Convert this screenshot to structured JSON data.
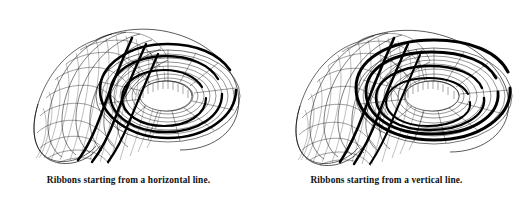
{
  "document": {
    "background_color": "#ffffff",
    "ink_color": "#000000",
    "width": 515,
    "height": 198
  },
  "figures": [
    {
      "id": "left-figure",
      "name": "ribbons-horizontal-start",
      "caption": "Ribbons starting from a horizontal line.",
      "description": "Wireframe mesh of a spiral tube (twisted torus) with thick black ribbon bands winding along its length.",
      "ribbon_start": "horizontal",
      "ribbon_count": 3,
      "mesh": {
        "u_divisions": 96,
        "v_divisions": 20,
        "line_color": "#000000",
        "fill_color": "#ffffff"
      }
    },
    {
      "id": "right-figure",
      "name": "ribbons-vertical-start",
      "caption": "Ribbons starting from a vertical line.",
      "description": "Wireframe mesh of a spiral tube (twisted torus) with thick black ribbon bands wrapped circumferentially.",
      "ribbon_start": "vertical",
      "ribbon_count": 3,
      "mesh": {
        "u_divisions": 96,
        "v_divisions": 20,
        "line_color": "#000000",
        "fill_color": "#ffffff"
      }
    }
  ]
}
